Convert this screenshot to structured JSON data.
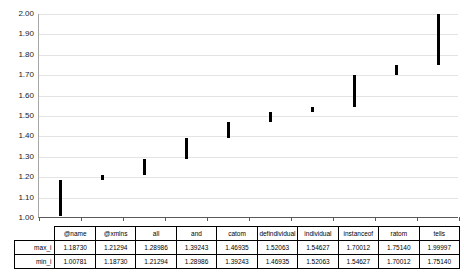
{
  "chart_data": {
    "type": "bar",
    "subtype": "floating-high-low",
    "title": "",
    "xlabel": "",
    "ylabel": "",
    "ylim": [
      1.0,
      2.0
    ],
    "ytick_step": 0.1,
    "ytick_labels": [
      "2.00",
      "1.90",
      "1.80",
      "1.70",
      "1.60",
      "1.50",
      "1.40",
      "1.30",
      "1.20",
      "1.10",
      "1.00"
    ],
    "ytick_values": [
      2.0,
      1.9,
      1.8,
      1.7,
      1.6,
      1.5,
      1.4,
      1.3,
      1.2,
      1.1,
      1.0
    ],
    "grid": true,
    "legend": "none",
    "categories": [
      "@name",
      "@xmlns",
      "all",
      "and",
      "catom",
      "defindividual",
      "individual",
      "instanceof",
      "ratom",
      "tells"
    ],
    "series": [
      {
        "name": "max_i",
        "values": [
          1.1873,
          1.21294,
          1.28986,
          1.39243,
          1.46935,
          1.52063,
          1.54627,
          1.70012,
          1.7514,
          1.99997
        ]
      },
      {
        "name": "min_i",
        "values": [
          1.00781,
          1.1873,
          1.21294,
          1.28986,
          1.39243,
          1.46935,
          1.52063,
          1.54627,
          1.70012,
          1.7514
        ]
      }
    ],
    "bar_color": "#000000"
  },
  "table": {
    "row_labels": [
      "max_i",
      "min_i"
    ],
    "headers": [
      "@name",
      "@xmlns",
      "all",
      "and",
      "catom",
      "defindividual",
      "individual",
      "instanceof",
      "ratom",
      "tells"
    ],
    "rows": [
      [
        "1.18730",
        "1.21294",
        "1.28986",
        "1.39243",
        "1.46935",
        "1.52063",
        "1.54627",
        "1.70012",
        "1.75140",
        "1.99997"
      ],
      [
        "1.00781",
        "1.18730",
        "1.21294",
        "1.28986",
        "1.39243",
        "1.46935",
        "1.52063",
        "1.54627",
        "1.70012",
        "1.75140"
      ]
    ]
  }
}
